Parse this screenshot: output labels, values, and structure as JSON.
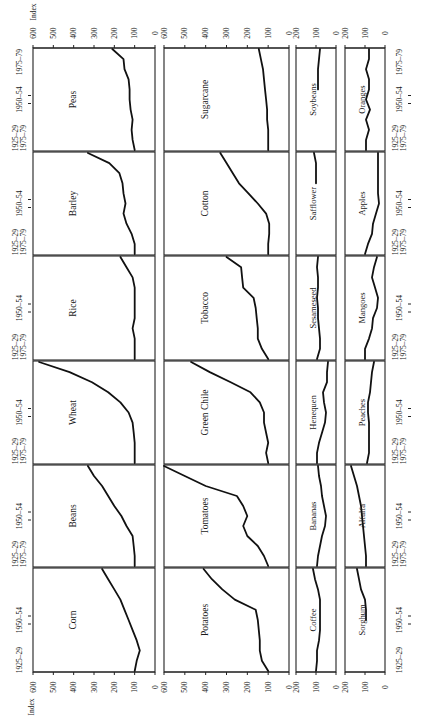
{
  "chart_data": {
    "type": "line",
    "title": "",
    "orientation": "rotated 90° clockwise (time runs bottom-to-top, index value runs right-to-left)",
    "xlabel": "",
    "ylabel": "Index",
    "x": [
      "1925–29",
      "1930–34",
      "1935–39",
      "1940–44",
      "1945–49",
      "1950–54",
      "1955–59",
      "1960–64",
      "1965–69",
      "1970–74",
      "1975–79"
    ],
    "x_tick_labels": [
      "1925–29",
      "1950–54",
      "1975–79"
    ],
    "grid": false,
    "layout": "6 rows × 4 columns of small multiples; columns 1–2 use index axis 0–600, columns 3–4 use index axis 0–200",
    "axis_ticks_large": [
      0,
      100,
      200,
      300,
      400,
      500,
      600
    ],
    "axis_ticks_small": [
      0,
      100,
      200
    ],
    "panels": [
      {
        "name": "Peas",
        "col": 0,
        "row": 0,
        "ylim": [
          0,
          600
        ],
        "values": [
          100,
          110,
          115,
          110,
          120,
          125,
          125,
          130,
          150,
          155,
          210
        ]
      },
      {
        "name": "Sugarcane",
        "col": 1,
        "row": 0,
        "ylim": [
          0,
          600
        ],
        "values": [
          100,
          100,
          100,
          105,
          105,
          110,
          115,
          120,
          125,
          135,
          145
        ]
      },
      {
        "name": "Soybeans",
        "col": 2,
        "row": 0,
        "ylim": [
          0,
          200
        ],
        "values": [
          null,
          null,
          null,
          null,
          null,
          null,
          90,
          90,
          90,
          85,
          80
        ]
      },
      {
        "name": "Oranges",
        "col": 3,
        "row": 0,
        "ylim": [
          0,
          200
        ],
        "values": [
          95,
          95,
          80,
          95,
          75,
          95,
          80,
          80,
          95,
          80,
          80
        ]
      },
      {
        "name": "Barley",
        "col": 0,
        "row": 1,
        "ylim": [
          0,
          600
        ],
        "values": [
          100,
          100,
          115,
          140,
          155,
          145,
          155,
          160,
          175,
          225,
          330
        ]
      },
      {
        "name": "Cotton",
        "col": 1,
        "row": 1,
        "ylim": [
          0,
          600
        ],
        "values": [
          100,
          100,
          95,
          95,
          110,
          150,
          195,
          240,
          270,
          300,
          330
        ]
      },
      {
        "name": "Safflower",
        "col": 2,
        "row": 1,
        "ylim": [
          0,
          200
        ],
        "values": [
          null,
          null,
          null,
          null,
          null,
          null,
          null,
          100,
          100,
          100,
          110
        ]
      },
      {
        "name": "Apples",
        "col": 3,
        "row": 1,
        "ylim": [
          0,
          200
        ],
        "values": [
          100,
          85,
          65,
          60,
          45,
          30,
          35,
          35,
          35,
          35,
          35
        ]
      },
      {
        "name": "Rice",
        "col": 0,
        "row": 2,
        "ylim": [
          0,
          600
        ],
        "values": [
          100,
          100,
          100,
          110,
          100,
          100,
          100,
          100,
          110,
          140,
          170
        ]
      },
      {
        "name": "Tobacco",
        "col": 1,
        "row": 2,
        "ylim": [
          0,
          600
        ],
        "values": [
          100,
          130,
          150,
          150,
          155,
          160,
          170,
          220,
          225,
          230,
          300
        ]
      },
      {
        "name": "Sesameseed",
        "col": 2,
        "row": 2,
        "ylim": [
          0,
          200
        ],
        "values": [
          95,
          80,
          80,
          85,
          90,
          90,
          95,
          90,
          90,
          95,
          90
        ]
      },
      {
        "name": "Mangoes",
        "col": 3,
        "row": 2,
        "ylim": [
          0,
          200
        ],
        "values": [
          100,
          100,
          80,
          65,
          60,
          40,
          35,
          50,
          65,
          55,
          40
        ]
      },
      {
        "name": "Wheat",
        "col": 0,
        "row": 3,
        "ylim": [
          0,
          600
        ],
        "values": [
          100,
          100,
          100,
          105,
          110,
          130,
          170,
          230,
          310,
          420,
          570
        ]
      },
      {
        "name": "Green Chile",
        "col": 1,
        "row": 3,
        "ylim": [
          0,
          600
        ],
        "values": [
          100,
          110,
          100,
          110,
          120,
          120,
          140,
          185,
          280,
          380,
          470
        ]
      },
      {
        "name": "Henequen",
        "col": 2,
        "row": 3,
        "ylim": [
          0,
          200
        ],
        "values": [
          95,
          95,
          85,
          70,
          55,
          50,
          60,
          65,
          45,
          45,
          40
        ]
      },
      {
        "name": "Peaches",
        "col": 3,
        "row": 3,
        "ylim": [
          0,
          200
        ],
        "values": [
          90,
          80,
          80,
          80,
          80,
          85,
          85,
          75,
          70,
          65,
          55
        ]
      },
      {
        "name": "Beans",
        "col": 0,
        "row": 4,
        "ylim": [
          0,
          600
        ],
        "values": [
          100,
          100,
          105,
          110,
          140,
          165,
          200,
          230,
          260,
          300,
          330
        ]
      },
      {
        "name": "Tomatoes",
        "col": 1,
        "row": 4,
        "ylim": [
          0,
          600
        ],
        "values": [
          100,
          120,
          150,
          200,
          220,
          200,
          220,
          250,
          400,
          500,
          600
        ]
      },
      {
        "name": "Bananas",
        "col": 2,
        "row": 4,
        "ylim": [
          0,
          200
        ],
        "values": [
          95,
          90,
          80,
          70,
          55,
          50,
          60,
          70,
          75,
          85,
          90
        ]
      },
      {
        "name": "Alfalfa",
        "col": 3,
        "row": 4,
        "ylim": [
          0,
          200
        ],
        "values": [
          95,
          95,
          100,
          105,
          110,
          115,
          120,
          130,
          140,
          155,
          170
        ]
      },
      {
        "name": "Corn",
        "col": 0,
        "row": 5,
        "ylim": [
          0,
          600
        ],
        "values": [
          100,
          90,
          75,
          90,
          110,
          130,
          150,
          170,
          200,
          230,
          260
        ]
      },
      {
        "name": "Potatoes",
        "col": 1,
        "row": 5,
        "ylim": [
          0,
          600
        ],
        "values": [
          100,
          130,
          140,
          140,
          145,
          150,
          160,
          260,
          320,
          370,
          410
        ]
      },
      {
        "name": "Coffee",
        "col": 2,
        "row": 5,
        "ylim": [
          0,
          200
        ],
        "values": [
          100,
          95,
          95,
          85,
          80,
          80,
          80,
          80,
          90,
          105,
          115
        ]
      },
      {
        "name": "Sorghum",
        "col": 3,
        "row": 5,
        "ylim": [
          0,
          200
        ],
        "values": [
          null,
          null,
          null,
          null,
          null,
          95,
          95,
          100,
          120,
          130,
          140
        ]
      }
    ]
  },
  "labels": {
    "index_label": "Index",
    "period_start": "1925–29",
    "period_mid": "1950–54",
    "period_end": "1975–79"
  }
}
